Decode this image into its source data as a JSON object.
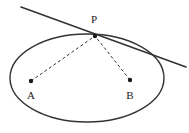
{
  "figure": {
    "background_color": "#ffffff",
    "stroke_color": "#333333",
    "label_color": "#1a1a1a",
    "labels": {
      "point_p": "P",
      "point_a": "A",
      "point_b": "B"
    },
    "points": {
      "P": {
        "x": 95,
        "y": 36,
        "kind": "point-on-ellipse",
        "marker": "dot"
      },
      "A": {
        "x": 31,
        "y": 81,
        "kind": "focus",
        "marker": "dot"
      },
      "B": {
        "x": 130,
        "y": 80,
        "kind": "focus",
        "marker": "dot"
      }
    },
    "ellipse": {
      "cx": 87,
      "cy": 78,
      "rx": 77,
      "ry": 44,
      "stroke_width": 1.4,
      "style": "solid"
    },
    "tangent_line": {
      "x1": 21,
      "y1": 7,
      "x2": 186,
      "y2": 67,
      "stroke_width": 1.6,
      "style": "solid",
      "touches_at": "P"
    },
    "segments": [
      {
        "name": "segment-AP",
        "from": "A",
        "to": "P",
        "style": "dashed",
        "dash": "3 2.5",
        "stroke_width": 1
      },
      {
        "name": "segment-BP",
        "from": "B",
        "to": "P",
        "style": "dashed",
        "dash": "3 2.5",
        "stroke_width": 1
      }
    ],
    "dot_radius": 2.2
  }
}
